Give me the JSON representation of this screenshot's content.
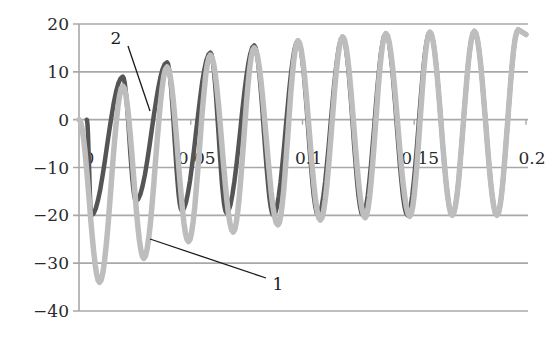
{
  "chart_data": {
    "type": "line",
    "title": "",
    "xlabel": "",
    "ylabel": "",
    "xlim": [
      0,
      0.2
    ],
    "ylim": [
      -40,
      20
    ],
    "grid": "horizontal",
    "legend": "none (curves labeled by leader-line annotations)",
    "x_ticks": [
      "0",
      "0.05",
      "0.1",
      "0.15",
      "0.2"
    ],
    "y_ticks": [
      "20",
      "10",
      "0",
      "−10",
      "−20",
      "−30",
      "−40"
    ],
    "frequency_hz": 50,
    "series": [
      {
        "name": "1",
        "color": "#bdbdbd",
        "description": "light gray sinusoid, starts at 0, large initial negative offset decaying",
        "peaks_x": [
          0.0196,
          0.0394,
          0.0588,
          0.0784,
          0.098,
          0.118,
          0.1373,
          0.157,
          0.1769,
          0.1965
        ],
        "peaks_y": [
          7,
          11,
          13.5,
          15,
          16.5,
          17.3,
          18,
          18.3,
          18.5,
          18.8
        ],
        "troughs_x": [
          0.0092,
          0.029,
          0.049,
          0.069,
          0.089,
          0.108,
          0.128,
          0.148,
          0.167,
          0.187
        ],
        "troughs_y": [
          -34,
          -29,
          -25.5,
          -23.5,
          -22,
          -21,
          -20.5,
          -20.2,
          -20,
          -20
        ]
      },
      {
        "name": "2",
        "color": "#555555",
        "description": "dark gray current, clipped start, converges with curve 1",
        "peaks_x": [
          0.0196,
          0.0394,
          0.0588,
          0.0784,
          0.098,
          0.118,
          0.1373,
          0.157,
          0.1769,
          0.1965
        ],
        "peaks_y": [
          9,
          12,
          14,
          15.5,
          16.5,
          17.3,
          18,
          18.3,
          18.5,
          18.8
        ],
        "troughs_x": [
          0.0055,
          0.0255,
          0.046,
          0.066,
          0.087,
          0.107,
          0.127,
          0.147,
          0.167,
          0.187
        ],
        "troughs_y": [
          -20,
          -17,
          -19,
          -19.5,
          -20,
          -20,
          -20,
          -20,
          -20,
          -20
        ]
      }
    ],
    "annotations": [
      {
        "label": "2",
        "text_x": 0.016,
        "text_y": 15,
        "points_to_x": 0.031,
        "points_to_y": 2
      },
      {
        "label": "1",
        "text_x": 0.086,
        "text_y": -34,
        "points_to_x": 0.033,
        "points_to_y": -25
      }
    ]
  },
  "labels": {
    "curve1": "1",
    "curve2": "2"
  }
}
